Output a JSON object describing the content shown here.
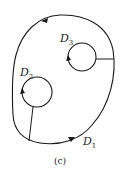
{
  "diagram": {
    "caption": "(c)",
    "regions": [
      {
        "name": "D",
        "sub": "1",
        "role": "outer boundary"
      },
      {
        "name": "D",
        "sub": "2",
        "role": "inner hole (left)"
      },
      {
        "name": "D",
        "sub": "3",
        "role": "inner hole (right)"
      }
    ],
    "stroke_color": "#1a1a1a",
    "background": "#ffffff"
  }
}
